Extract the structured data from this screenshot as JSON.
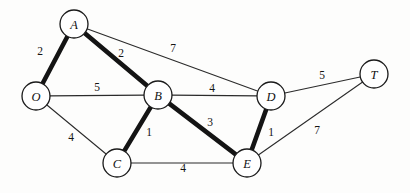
{
  "chart_data": {
    "type": "diagram",
    "title": "",
    "nodes": [
      {
        "id": "A",
        "label": "A",
        "x": 74,
        "y": 24,
        "r": 14
      },
      {
        "id": "O",
        "label": "O",
        "x": 36,
        "y": 96,
        "r": 14
      },
      {
        "id": "B",
        "label": "B",
        "x": 158,
        "y": 95,
        "r": 14
      },
      {
        "id": "D",
        "label": "D",
        "x": 271,
        "y": 96,
        "r": 14
      },
      {
        "id": "T",
        "label": "T",
        "x": 374,
        "y": 74,
        "r": 14
      },
      {
        "id": "C",
        "label": "C",
        "x": 117,
        "y": 163,
        "r": 14
      },
      {
        "id": "E",
        "label": "E",
        "x": 247,
        "y": 163,
        "r": 14
      }
    ],
    "edges": [
      {
        "from": "A",
        "to": "O",
        "weight": "2",
        "bold": true,
        "lx": 40,
        "ly": 51
      },
      {
        "from": "A",
        "to": "B",
        "weight": "2",
        "bold": true,
        "lx": 121,
        "ly": 53
      },
      {
        "from": "A",
        "to": "D",
        "weight": "7",
        "bold": false,
        "lx": 173,
        "ly": 48
      },
      {
        "from": "O",
        "to": "B",
        "weight": "5",
        "bold": false,
        "lx": 97,
        "ly": 87
      },
      {
        "from": "O",
        "to": "C",
        "weight": "4",
        "bold": false,
        "lx": 71,
        "ly": 137
      },
      {
        "from": "B",
        "to": "C",
        "weight": "1",
        "bold": true,
        "lx": 149,
        "ly": 132
      },
      {
        "from": "B",
        "to": "D",
        "weight": "4",
        "bold": false,
        "lx": 212,
        "ly": 88
      },
      {
        "from": "B",
        "to": "E",
        "weight": "3",
        "bold": true,
        "lx": 210,
        "ly": 122
      },
      {
        "from": "C",
        "to": "E",
        "weight": "4",
        "bold": false,
        "lx": 183,
        "ly": 168
      },
      {
        "from": "D",
        "to": "E",
        "weight": "1",
        "bold": true,
        "lx": 271,
        "ly": 132
      },
      {
        "from": "D",
        "to": "T",
        "weight": "5",
        "bold": false,
        "lx": 322,
        "ly": 75
      },
      {
        "from": "E",
        "to": "T",
        "weight": "7",
        "bold": false,
        "lx": 317,
        "ly": 130
      }
    ],
    "colors": {
      "node_fill": "#ffffff",
      "node_stroke": "#1a1a1a",
      "edge_thin": "#2b2b2b",
      "edge_bold": "#141414",
      "background": "#fdfdfc"
    },
    "node_radius": 14,
    "bold_edge_width": 4.6,
    "thin_edge_width": 1.1
  }
}
